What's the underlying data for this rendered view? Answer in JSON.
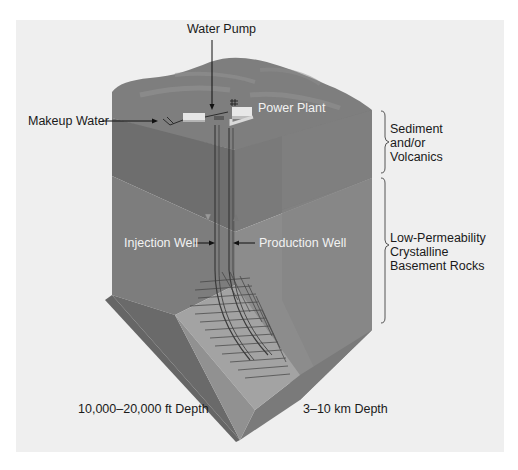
{
  "diagram": {
    "labels": {
      "water_pump": "Water Pump",
      "makeup_water": "Makeup Water",
      "power_plant": "Power Plant",
      "injection_well": "Injection Well",
      "production_well": "Production Well",
      "sediment": "Sediment\nand/or\nVolcanics",
      "basement": "Low-Permeability\nCrystalline\nBasement Rocks",
      "depth_ft": "10,000–20,000 ft Depth",
      "depth_km": "3–10 km Depth"
    },
    "flow_markers": {
      "injection": "down-triangle",
      "production": "up-triangle"
    },
    "colors": {
      "background": "#efefef",
      "surface_top": "#7e7e7e",
      "left_face_upper": "#6e6e6e",
      "left_face_lower": "#858585",
      "right_face_upper": "#7a7a7a",
      "right_face_lower": "#8c8c8c",
      "fracture_zone": "#a3a3a3",
      "text_dark": "#1a1a1a",
      "text_light": "#f2f2f2"
    }
  }
}
